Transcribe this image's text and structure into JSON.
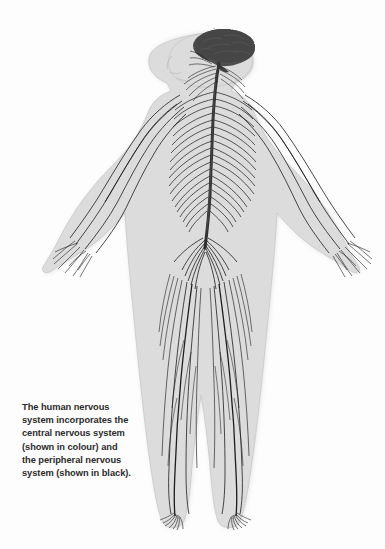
{
  "figure": {
    "name": "human-nervous-system-diagram",
    "orientation": "front-facing body, head in left profile, arms spread downward and outward",
    "parts": [
      {
        "id": "brain",
        "label": "brain",
        "system": "central",
        "color": "#4a4a4a"
      },
      {
        "id": "spinal-cord",
        "label": "spinal cord",
        "system": "central",
        "color": "#3a3a3a"
      },
      {
        "id": "cranial-nerves",
        "label": "cranial nerves",
        "system": "peripheral",
        "color": "#1d1d1d"
      },
      {
        "id": "cervical-nerves",
        "label": "cervical nerves",
        "system": "peripheral",
        "color": "#1d1d1d"
      },
      {
        "id": "thoracic-nerves",
        "label": "thoracic nerves",
        "system": "peripheral",
        "color": "#1d1d1d"
      },
      {
        "id": "brachial-plexus",
        "label": "brachial plexus",
        "system": "peripheral",
        "color": "#1d1d1d"
      },
      {
        "id": "lumbar-plexus",
        "label": "lumbar plexus",
        "system": "peripheral",
        "color": "#1d1d1d"
      },
      {
        "id": "sciatic-nerve",
        "label": "sciatic nerve",
        "system": "peripheral",
        "color": "#1d1d1d"
      },
      {
        "id": "hand-nerves",
        "label": "hand nerves",
        "system": "peripheral",
        "color": "#1d1d1d"
      },
      {
        "id": "foot-nerves",
        "label": "foot nerves",
        "system": "peripheral",
        "color": "#1d1d1d"
      }
    ],
    "colors": {
      "background": "#fdfdfd",
      "body_fill": "#dcdcdc",
      "body_edge": "#c6c6c6",
      "brain_fill": "#4a4a4a",
      "brain_edge": "#3a3a3a",
      "nerve": "#1d1d1d",
      "caption_text": "#2b2b2b"
    }
  },
  "caption": {
    "lines": [
      "The human nervous",
      "system incorporates the",
      "central nervous system",
      "(shown in colour) and",
      "the peripheral nervous",
      "system (shown in black)."
    ],
    "full_text": "The human nervous system incorporates the central nervous system (shown in colour) and the peripheral nervous system (shown in black)."
  },
  "artifact": {
    "note": "faint illegible scan smudge near upper right",
    "text": ""
  }
}
